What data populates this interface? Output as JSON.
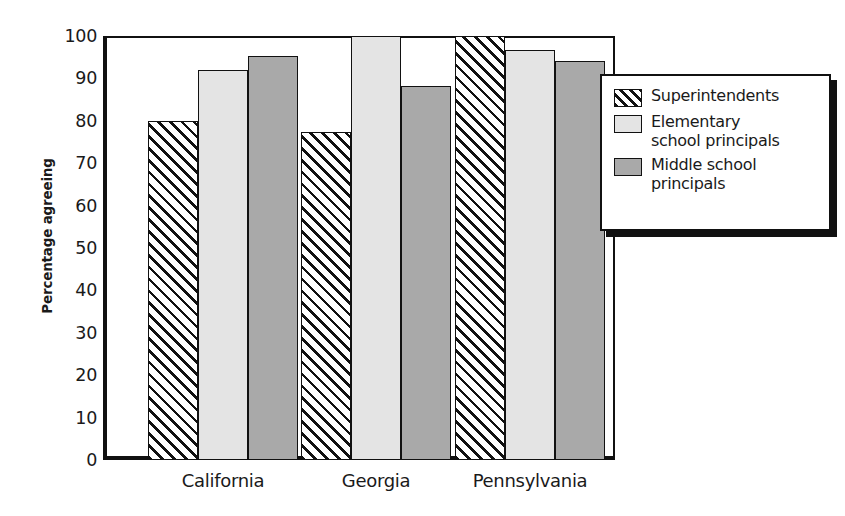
{
  "chart_data": {
    "type": "bar",
    "title": "",
    "xlabel": "",
    "ylabel": "Percentage agreeing",
    "ylim": [
      0,
      100
    ],
    "ytick_step": 10,
    "yticks": [
      0,
      10,
      20,
      30,
      40,
      50,
      60,
      70,
      80,
      90,
      100
    ],
    "ytick_labels": [
      "0",
      "10",
      "20",
      "30",
      "40",
      "50",
      "60",
      "70",
      "80",
      "90",
      "100"
    ],
    "grid": false,
    "legend_position": "right",
    "categories": [
      "California",
      "Georgia",
      "Pennsylvania"
    ],
    "series": [
      {
        "name": "Superintendents",
        "pattern": "diagonal-hatch",
        "color": "#ffffff",
        "values": [
          80,
          77.4,
          100
        ]
      },
      {
        "name": "Elementary school principals",
        "pattern": "solid",
        "color": "#e4e4e4",
        "values": [
          92,
          100,
          96.6
        ]
      },
      {
        "name": "Middle school principals",
        "pattern": "solid",
        "color": "#a9a9a9",
        "values": [
          95.3,
          88.3,
          94.2
        ]
      }
    ]
  },
  "legend": {
    "entries": [
      {
        "label": "Superintendents",
        "swatch": "hatch"
      },
      {
        "label": "Elementary\nschool principals",
        "swatch": "light"
      },
      {
        "label": "Middle school\nprincipals",
        "swatch": "medium"
      }
    ]
  },
  "colors": {
    "axis": "#111111",
    "text": "#1a1a1a",
    "series_light": "#e4e4e4",
    "series_medium": "#a9a9a9",
    "background": "#ffffff"
  }
}
